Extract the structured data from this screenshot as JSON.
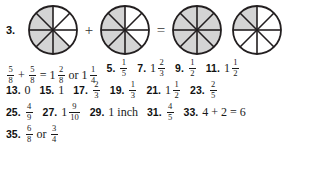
{
  "page": {
    "kind": "math-answer-key",
    "background_color": "#ffffff",
    "text_color": "#1a1a1a"
  },
  "diagram": {
    "problem_number": "3.",
    "shade_color": "#d4d4d4",
    "stroke_color": "#231f20",
    "sectors": 8,
    "operators": {
      "plus": "+",
      "equals": "="
    },
    "circles": [
      {
        "name": "circle-1",
        "sectors": 8,
        "shaded": 5,
        "shaded_indices": [
          3,
          4,
          5,
          6,
          7
        ]
      },
      {
        "name": "circle-2",
        "sectors": 8,
        "shaded": 5,
        "shaded_indices": [
          3,
          4,
          5,
          6,
          7
        ]
      },
      {
        "name": "circle-3",
        "sectors": 8,
        "shaded": 8,
        "shaded_indices": [
          0,
          1,
          2,
          3,
          4,
          5,
          6,
          7
        ]
      },
      {
        "name": "circle-4",
        "sectors": 8,
        "shaded": 2,
        "shaded_indices": [
          6,
          7
        ]
      }
    ]
  },
  "answers": {
    "rows": [
      {
        "items": [
          {
            "number": "",
            "parts": [
              {
                "type": "fraction",
                "num": "5",
                "den": "8"
              },
              {
                "type": "text",
                "text": "+"
              },
              {
                "type": "fraction",
                "num": "5",
                "den": "8"
              },
              {
                "type": "text",
                "text": "="
              },
              {
                "type": "whole",
                "text": "1"
              },
              {
                "type": "fraction",
                "num": "2",
                "den": "8"
              },
              {
                "type": "word",
                "text": "or"
              },
              {
                "type": "whole",
                "text": "1"
              },
              {
                "type": "fraction",
                "num": "1",
                "den": "4"
              }
            ]
          },
          {
            "number": "5.",
            "parts": [
              {
                "type": "fraction",
                "num": "1",
                "den": "5"
              }
            ]
          },
          {
            "number": "7.",
            "parts": [
              {
                "type": "whole",
                "text": "1"
              },
              {
                "type": "fraction",
                "num": "2",
                "den": "3"
              }
            ]
          },
          {
            "number": "9.",
            "parts": [
              {
                "type": "fraction",
                "num": "1",
                "den": "2"
              }
            ]
          },
          {
            "number": "11.",
            "parts": [
              {
                "type": "whole",
                "text": "1"
              },
              {
                "type": "fraction",
                "num": "1",
                "den": "2"
              }
            ]
          }
        ]
      },
      {
        "items": [
          {
            "number": "13.",
            "parts": [
              {
                "type": "plain",
                "text": "0"
              }
            ]
          },
          {
            "number": "15.",
            "parts": [
              {
                "type": "plain",
                "text": "1"
              }
            ]
          },
          {
            "number": "17.",
            "parts": [
              {
                "type": "fraction",
                "num": "2",
                "den": "3"
              }
            ]
          },
          {
            "number": "19.",
            "parts": [
              {
                "type": "fraction",
                "num": "1",
                "den": "3"
              }
            ]
          },
          {
            "number": "21.",
            "parts": [
              {
                "type": "whole",
                "text": "1"
              },
              {
                "type": "fraction",
                "num": "1",
                "den": "2"
              }
            ]
          },
          {
            "number": "23.",
            "parts": [
              {
                "type": "fraction",
                "num": "2",
                "den": "5"
              }
            ]
          }
        ]
      },
      {
        "items": [
          {
            "number": "25.",
            "parts": [
              {
                "type": "fraction",
                "num": "4",
                "den": "9"
              }
            ]
          },
          {
            "number": "27.",
            "parts": [
              {
                "type": "whole",
                "text": "1"
              },
              {
                "type": "fraction",
                "num": "9",
                "den": "10"
              }
            ]
          },
          {
            "number": "29.",
            "parts": [
              {
                "type": "plain",
                "text": "1 inch"
              }
            ]
          },
          {
            "number": "31.",
            "parts": [
              {
                "type": "fraction",
                "num": "4",
                "den": "5"
              }
            ]
          },
          {
            "number": "33.",
            "parts": [
              {
                "type": "plain",
                "text": "4 + 2 = 6"
              }
            ]
          }
        ]
      },
      {
        "items": [
          {
            "number": "35.",
            "parts": [
              {
                "type": "fraction",
                "num": "6",
                "den": "8"
              },
              {
                "type": "word",
                "text": "or"
              },
              {
                "type": "fraction",
                "num": "3",
                "den": "4"
              }
            ]
          }
        ]
      }
    ]
  }
}
